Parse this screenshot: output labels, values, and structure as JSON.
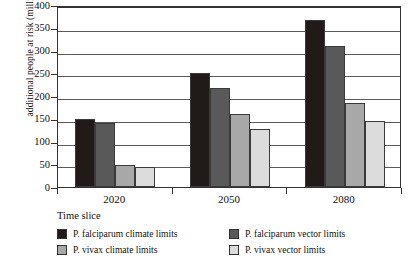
{
  "chart_data": {
    "type": "bar",
    "title": "",
    "xlabel": "",
    "ylabel": "additional people at risk (millions)",
    "categories": [
      "2020",
      "2050",
      "2080"
    ],
    "ylim": [
      0,
      400
    ],
    "yticks": [
      0,
      50,
      100,
      150,
      200,
      250,
      300,
      350,
      400
    ],
    "ytick_labels": [
      "0",
      "50",
      "100",
      "150",
      "200",
      "250",
      "300",
      "350",
      "400"
    ],
    "grid": true,
    "legend_position": "below-left",
    "legend_title": "Time slice",
    "series": [
      {
        "name": "P. falciparum climate limits",
        "color": "#221a18",
        "values": [
          150,
          250,
          368
        ]
      },
      {
        "name": "P. falciparum vector limits",
        "color": "#595959",
        "values": [
          140,
          218,
          310
        ]
      },
      {
        "name": "P. vivax climate limits",
        "color": "#a8a8a8",
        "values": [
          48,
          160,
          185
        ]
      },
      {
        "name": "P. vivax vector limits",
        "color": "#dcdcdc",
        "values": [
          45,
          128,
          145
        ]
      }
    ],
    "legend_order": [
      "P. falciparum climate limits",
      "P. falciparum vector limits",
      "P. vivax climate limits",
      "P. vivax vector limits"
    ]
  }
}
